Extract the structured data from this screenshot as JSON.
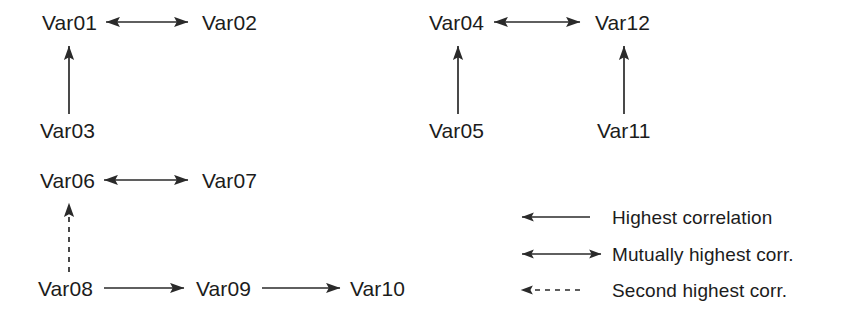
{
  "figure": {
    "type": "diagram",
    "background_color": "#ffffff",
    "line_color": "#2a2a2a",
    "text_color": "#1c1c1c"
  },
  "nodes": [
    {
      "id": "Var01",
      "label": "Var01",
      "x": 42,
      "y": 12
    },
    {
      "id": "Var02",
      "label": "Var02",
      "x": 202,
      "y": 12
    },
    {
      "id": "Var03",
      "label": "Var03",
      "x": 40,
      "y": 120
    },
    {
      "id": "Var04",
      "label": "Var04",
      "x": 429,
      "y": 12
    },
    {
      "id": "Var12",
      "label": "Var12",
      "x": 595,
      "y": 12
    },
    {
      "id": "Var05",
      "label": "Var05",
      "x": 429,
      "y": 120
    },
    {
      "id": "Var11",
      "label": "Var11",
      "x": 597,
      "y": 120
    },
    {
      "id": "Var06",
      "label": "Var06",
      "x": 40,
      "y": 170
    },
    {
      "id": "Var07",
      "label": "Var07",
      "x": 202,
      "y": 170
    },
    {
      "id": "Var08",
      "label": "Var08",
      "x": 38,
      "y": 278
    },
    {
      "id": "Var09",
      "label": "Var09",
      "x": 196,
      "y": 278
    },
    {
      "id": "Var10",
      "label": "Var10",
      "x": 350,
      "y": 278
    }
  ],
  "edges": [
    {
      "from": "Var01",
      "to": "Var02",
      "style": "mutual",
      "x1": 106,
      "y1": 22,
      "x2": 188,
      "y2": 22
    },
    {
      "from": "Var03",
      "to": "Var01",
      "style": "single",
      "x1": 69,
      "y1": 114,
      "x2": 69,
      "y2": 46
    },
    {
      "from": "Var04",
      "to": "Var12",
      "style": "mutual",
      "x1": 494,
      "y1": 22,
      "x2": 580,
      "y2": 22
    },
    {
      "from": "Var05",
      "to": "Var04",
      "style": "single",
      "x1": 458,
      "y1": 114,
      "x2": 458,
      "y2": 46
    },
    {
      "from": "Var11",
      "to": "Var12",
      "style": "single",
      "x1": 624,
      "y1": 114,
      "x2": 624,
      "y2": 46
    },
    {
      "from": "Var06",
      "to": "Var07",
      "style": "mutual",
      "x1": 104,
      "y1": 180,
      "x2": 188,
      "y2": 180
    },
    {
      "from": "Var08",
      "to": "Var06",
      "style": "dashed",
      "x1": 69,
      "y1": 272,
      "x2": 69,
      "y2": 203
    },
    {
      "from": "Var08",
      "to": "Var09",
      "style": "single",
      "x1": 104,
      "y1": 288,
      "x2": 184,
      "y2": 288
    },
    {
      "from": "Var09",
      "to": "Var10",
      "style": "single",
      "x1": 262,
      "y1": 288,
      "x2": 340,
      "y2": 288
    }
  ],
  "legend": {
    "items": [
      {
        "label": "Highest correlation",
        "style": "single",
        "x1": 590,
        "x2": 522,
        "y": 217
      },
      {
        "label": "Mutually highest corr.",
        "style": "mutual",
        "x1": 522,
        "x2": 601,
        "y": 254
      },
      {
        "label": "Second highest corr.",
        "style": "dashed",
        "x1": 580,
        "x2": 521,
        "y": 290
      }
    ],
    "label_x": 612,
    "label_offsets_y": [
      217,
      254,
      290
    ]
  }
}
